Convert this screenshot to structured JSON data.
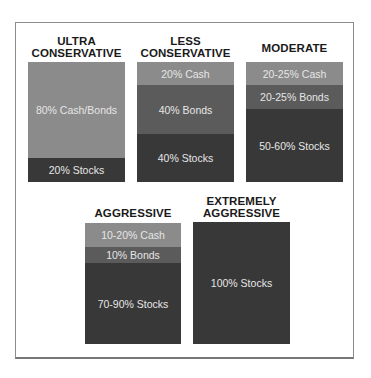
{
  "colors": {
    "cash": "#8b8b8b",
    "bonds": "#5b5b5b",
    "stocks": "#383838",
    "cash_bonds": "#8b8b8b",
    "frame": "#8c8c8c"
  },
  "portfolios": [
    {
      "title_line1": "ULTRA",
      "title_line2": "CONSERVATIVE",
      "segments": [
        {
          "label": "80% Cash/Bonds",
          "type": "cash_bonds"
        },
        {
          "label": "20% Stocks",
          "type": "stocks"
        }
      ]
    },
    {
      "title_line1": "LESS",
      "title_line2": "CONSERVATIVE",
      "segments": [
        {
          "label": "20% Cash",
          "type": "cash"
        },
        {
          "label": "40% Bonds",
          "type": "bonds"
        },
        {
          "label": "40% Stocks",
          "type": "stocks"
        }
      ]
    },
    {
      "title_line1": "MODERATE",
      "segments": [
        {
          "label": "20-25% Cash",
          "type": "cash"
        },
        {
          "label": "20-25% Bonds",
          "type": "bonds"
        },
        {
          "label": "50-60% Stocks",
          "type": "stocks"
        }
      ]
    },
    {
      "title_line1": "AGGRESSIVE",
      "segments": [
        {
          "label": "10-20% Cash",
          "type": "cash"
        },
        {
          "label": "10% Bonds",
          "type": "bonds"
        },
        {
          "label": "70-90% Stocks",
          "type": "stocks"
        }
      ]
    },
    {
      "title_line1": "EXTREMELY",
      "title_line2": "AGGRESSIVE",
      "segments": [
        {
          "label": "100% Stocks",
          "type": "stocks"
        }
      ]
    }
  ]
}
